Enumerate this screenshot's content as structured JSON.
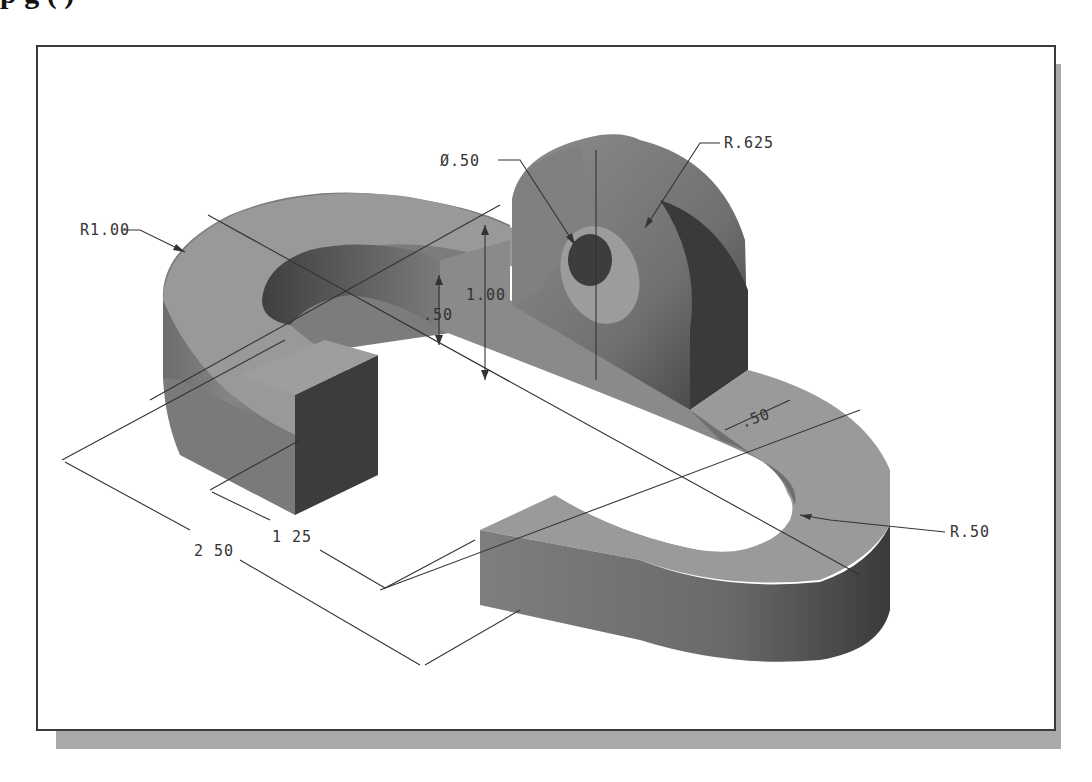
{
  "caption": "  p   g     (                                                  )",
  "drawing": {
    "title": "Isometric part drawing",
    "colors": {
      "top_face": "#9a9a9a",
      "side_face": "#7a7a7a",
      "dark_face": "#4a4a4a",
      "hole": "#3e3e3e",
      "frame_shadow": "#a9a9a9",
      "line": "#333333"
    },
    "dimensions": {
      "r_one": "R1.00",
      "dia_half": "Ø.50",
      "r_625": "R.625",
      "h_one": "1.00",
      "h_half": ".50",
      "w_half": ".50",
      "r_half": "R.50",
      "len_125": "1 25",
      "len_250": "2 50"
    }
  }
}
